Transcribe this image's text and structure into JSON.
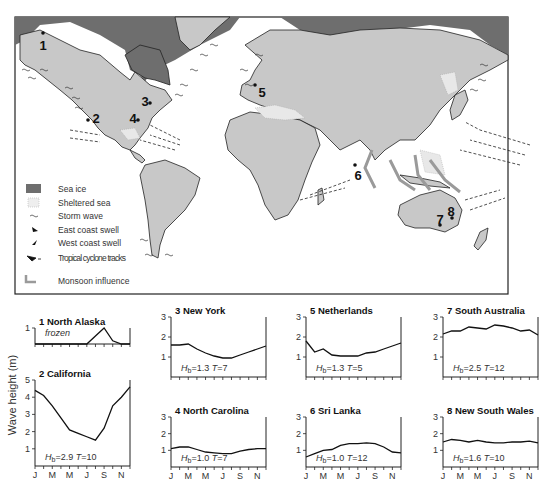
{
  "map": {
    "site_labels": [
      "1",
      "2",
      "3",
      "4",
      "5",
      "6",
      "7",
      "8"
    ],
    "legend": [
      {
        "icon": "sea-ice-swatch",
        "label": "Sea ice"
      },
      {
        "icon": "sheltered-sea-swatch",
        "label": "Sheltered sea"
      },
      {
        "icon": "storm-wave-icon",
        "label": "Storm wave"
      },
      {
        "icon": "east-coast-swell-icon",
        "label": "East coast swell"
      },
      {
        "icon": "west-coast-swell-icon",
        "label": "West coast swell"
      },
      {
        "icon": "tropical-cyclone-icon",
        "label": "Tropical cyclone tracks"
      },
      {
        "icon": "monsoon-arrow-icon",
        "label": "Monsoon influence"
      }
    ],
    "colors": {
      "land": "#c8c8c8",
      "sea_ice": "#6e6e6e",
      "monsoon": "#9a9a9a",
      "ocean": "#ffffff"
    }
  },
  "ylabel": "Wave height (m)",
  "chart_data": [
    {
      "type": "line",
      "title": "1 North Alaska",
      "annotation": "frozen",
      "categories": [
        "J",
        "F",
        "M",
        "A",
        "M",
        "J",
        "J",
        "A",
        "S",
        "O",
        "N",
        "D"
      ],
      "tick_labels": [
        "J",
        "M",
        "M",
        "J",
        "S",
        "N"
      ],
      "values": [
        0,
        0,
        0,
        0,
        0,
        0,
        0,
        0.5,
        1.0,
        0.2,
        0,
        0
      ],
      "ylim": [
        0,
        1
      ],
      "yticks": [
        1
      ],
      "Hb": null,
      "T": null
    },
    {
      "type": "line",
      "title": "2 California",
      "categories": [
        "J",
        "F",
        "M",
        "A",
        "M",
        "J",
        "J",
        "A",
        "S",
        "O",
        "N",
        "D"
      ],
      "tick_labels": [
        "J",
        "M",
        "M",
        "J",
        "S",
        "N"
      ],
      "values": [
        4.4,
        4.1,
        3.5,
        2.8,
        2.1,
        1.9,
        1.7,
        1.5,
        2.2,
        3.5,
        4.0,
        4.6
      ],
      "ylim": [
        0,
        5
      ],
      "yticks": [
        1,
        2,
        3,
        4,
        5
      ],
      "Hb": "2.9",
      "T": "10"
    },
    {
      "type": "line",
      "title": "3 New York",
      "categories": [
        "J",
        "F",
        "M",
        "A",
        "M",
        "J",
        "J",
        "A",
        "S",
        "O",
        "N",
        "D"
      ],
      "tick_labels": [
        "J",
        "M",
        "M",
        "J",
        "S",
        "N"
      ],
      "values": [
        1.6,
        1.6,
        1.65,
        1.4,
        1.2,
        1.05,
        0.95,
        0.95,
        1.1,
        1.25,
        1.4,
        1.55
      ],
      "ylim": [
        0,
        3
      ],
      "yticks": [
        1,
        2,
        3
      ],
      "Hb": "1.3",
      "T": "7"
    },
    {
      "type": "line",
      "title": "4 North Carolina",
      "categories": [
        "J",
        "F",
        "M",
        "A",
        "M",
        "J",
        "J",
        "A",
        "S",
        "O",
        "N",
        "D"
      ],
      "tick_labels": [
        "J",
        "M",
        "M",
        "J",
        "S",
        "N"
      ],
      "values": [
        1.1,
        1.2,
        1.2,
        1.05,
        0.9,
        0.85,
        0.8,
        0.8,
        0.95,
        1.05,
        1.1,
        1.1
      ],
      "ylim": [
        0,
        3
      ],
      "yticks": [
        1,
        2,
        3
      ],
      "Hb": "1.0",
      "T": "7"
    },
    {
      "type": "line",
      "title": "5 Netherlands",
      "categories": [
        "J",
        "F",
        "M",
        "A",
        "M",
        "J",
        "J",
        "A",
        "S",
        "O",
        "N",
        "D"
      ],
      "tick_labels": [
        "J",
        "M",
        "M",
        "J",
        "S",
        "N"
      ],
      "values": [
        1.8,
        1.25,
        1.4,
        1.1,
        1.05,
        1.05,
        1.05,
        1.2,
        1.25,
        1.4,
        1.55,
        1.7
      ],
      "ylim": [
        0,
        3
      ],
      "yticks": [
        1,
        2,
        3
      ],
      "Hb": "1.3",
      "T": "5"
    },
    {
      "type": "line",
      "title": "6 Sri Lanka",
      "categories": [
        "J",
        "F",
        "M",
        "A",
        "M",
        "J",
        "J",
        "A",
        "S",
        "O",
        "N",
        "D"
      ],
      "tick_labels": [
        "J",
        "M",
        "M",
        "J",
        "S",
        "N"
      ],
      "values": [
        0.6,
        0.8,
        1.0,
        1.05,
        1.3,
        1.4,
        1.4,
        1.45,
        1.4,
        1.2,
        0.9,
        0.85
      ],
      "ylim": [
        0,
        3
      ],
      "yticks": [
        1,
        2,
        3
      ],
      "Hb": "1.0",
      "T": "12"
    },
    {
      "type": "line",
      "title": "7 South Australia",
      "categories": [
        "J",
        "F",
        "M",
        "A",
        "M",
        "J",
        "J",
        "A",
        "S",
        "O",
        "N",
        "D"
      ],
      "tick_labels": [
        "J",
        "M",
        "M",
        "J",
        "S",
        "N"
      ],
      "values": [
        2.15,
        2.3,
        2.3,
        2.5,
        2.45,
        2.4,
        2.6,
        2.55,
        2.45,
        2.3,
        2.35,
        2.1
      ],
      "ylim": [
        0,
        3
      ],
      "yticks": [
        1,
        2,
        3
      ],
      "Hb": "2.5",
      "T": "12"
    },
    {
      "type": "line",
      "title": "8 New South Wales",
      "categories": [
        "J",
        "F",
        "M",
        "A",
        "M",
        "J",
        "J",
        "A",
        "S",
        "O",
        "N",
        "D"
      ],
      "tick_labels": [
        "J",
        "M",
        "M",
        "J",
        "S",
        "N"
      ],
      "values": [
        1.5,
        1.65,
        1.6,
        1.5,
        1.6,
        1.5,
        1.45,
        1.45,
        1.5,
        1.5,
        1.55,
        1.45
      ],
      "ylim": [
        0,
        3
      ],
      "yticks": [
        1,
        2,
        3
      ],
      "Hb": "1.6",
      "T": "10"
    }
  ]
}
